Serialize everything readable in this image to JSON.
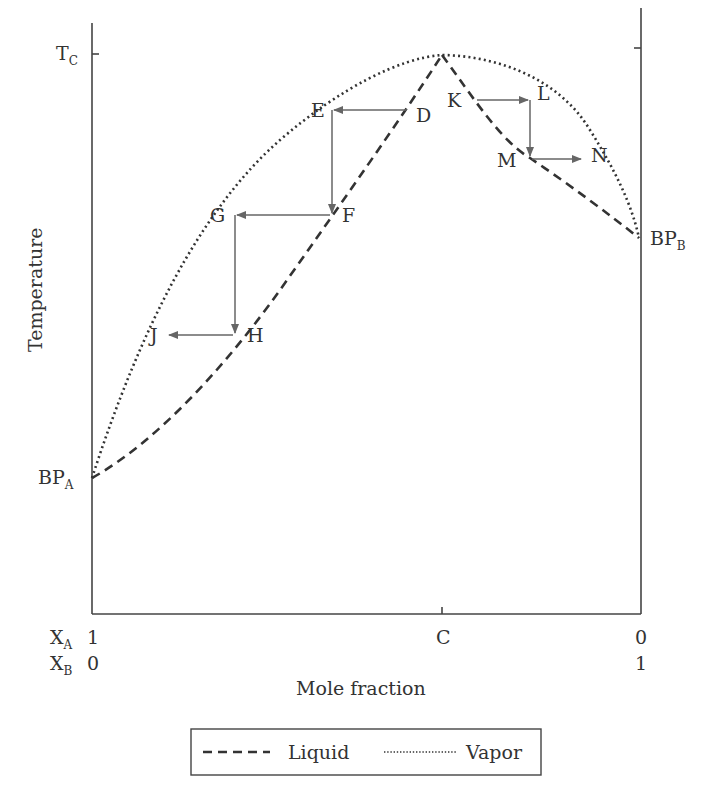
{
  "diagram": {
    "type": "boiling-point diagram (maximum-boiling azeotrope)",
    "y_axis": {
      "label": "Temperature",
      "ticks": [
        "T_C"
      ]
    },
    "x_axis": {
      "label": "Mole fraction",
      "row_xa": {
        "name": "X",
        "sub": "A",
        "left": "1",
        "right": "0"
      },
      "row_xb": {
        "name": "X",
        "sub": "B",
        "left": "0",
        "right": "1"
      },
      "mid_tick": "C"
    },
    "left_point": {
      "main": "BP",
      "sub": "A"
    },
    "right_point": {
      "main": "BP",
      "sub": "B"
    },
    "tc_label": {
      "main": "T",
      "sub": "C"
    },
    "points": {
      "D": "D",
      "E": "E",
      "F": "F",
      "G": "G",
      "H": "H",
      "J": "J",
      "K": "K",
      "L": "L",
      "M": "M",
      "N": "N"
    },
    "legend": {
      "liquid": "Liquid",
      "vapor": "Vapor"
    }
  }
}
